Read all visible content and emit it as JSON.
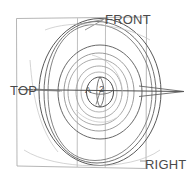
{
  "figure": {
    "kind": "hand-drawn-technical-sketch",
    "background_color": "#ffffff",
    "ink_color": "#555555",
    "light_ink_color": "#a8a8a8",
    "frame_color": "#9a9a9a"
  },
  "labels": {
    "front": "FRONT",
    "top": "TOP",
    "right": "RIGHT",
    "center_letter": "A",
    "center_number": "2"
  },
  "annotations": {
    "view_labels": [
      "FRONT",
      "TOP",
      "RIGHT"
    ],
    "center_tag": "A 2"
  },
  "geometry": {
    "frame": {
      "left": 16,
      "top": 17,
      "right": 146,
      "bottom": 168,
      "inner_vertical_lines": [
        77,
        105
      ]
    },
    "center": {
      "x": 100,
      "y": 92
    },
    "ellipses": [
      {
        "name": "outer-ring-a",
        "rx": 62,
        "ry": 74,
        "stroke": "#5a5a5a"
      },
      {
        "name": "outer-ring-b",
        "rx": 58,
        "ry": 70,
        "stroke": "#6a6a6a"
      },
      {
        "name": "mid-ring-a",
        "rx": 42,
        "ry": 50,
        "stroke": "#5f5f5f"
      },
      {
        "name": "mid-ring-b",
        "rx": 32,
        "ry": 38,
        "stroke": "#8a8a8a"
      },
      {
        "name": "inner-ring-a",
        "rx": 24,
        "ry": 28,
        "stroke": "#9a9a9a"
      },
      {
        "name": "inner-ring-b",
        "rx": 17,
        "ry": 20,
        "stroke": "#a5a5a5"
      },
      {
        "name": "core-sphere",
        "rx": 13,
        "ry": 15,
        "stroke": "#4f4f4f"
      }
    ],
    "axis": {
      "name": "horizontal-spindle-axis",
      "x1": 18,
      "x2": 184,
      "y": 92,
      "arrow_tip_x": 184
    },
    "leader_lines": [
      {
        "name": "front-leader",
        "from": [
          104,
          18
        ],
        "to": [
          78,
          24
        ]
      },
      {
        "name": "top-leader",
        "from": [
          36,
          89
        ],
        "to": [
          60,
          92
        ]
      },
      {
        "name": "right-leader",
        "from": [
          146,
          162
        ],
        "to": [
          140,
          162
        ]
      }
    ]
  }
}
